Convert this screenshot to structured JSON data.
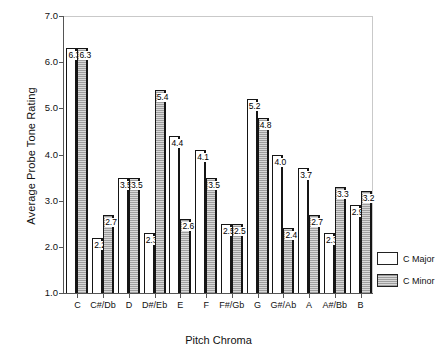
{
  "chart_data": {
    "type": "bar",
    "title": "",
    "xlabel": "Pitch Chroma",
    "ylabel": "Average Probe Tone Rating",
    "ylim": [
      1.0,
      7.0
    ],
    "ytick_step": 1.0,
    "yticks": [
      "1.0",
      "2.0",
      "3.0",
      "4.0",
      "5.0",
      "6.0",
      "7.0"
    ],
    "grid": false,
    "legend_position": "right-bottom-outside",
    "categories": [
      "C",
      "C#/Db",
      "D",
      "D#/Eb",
      "E",
      "F",
      "F#/Gb",
      "G",
      "G#/Ab",
      "A",
      "A#/Bb",
      "B"
    ],
    "series": [
      {
        "name": "C Major",
        "style": "white",
        "values": [
          6.3,
          2.2,
          3.5,
          2.3,
          4.4,
          4.1,
          2.5,
          5.2,
          4.0,
          3.7,
          2.3,
          2.9
        ],
        "labels": [
          "6.3",
          "2.2",
          "3.5",
          "2.3",
          "4.4",
          "4.1",
          "2.5",
          "5.2",
          "4.0",
          "3.7",
          "2.3",
          "2.9"
        ]
      },
      {
        "name": "C Minor",
        "style": "hatched-gray",
        "values": [
          6.3,
          2.7,
          3.5,
          5.4,
          2.6,
          3.5,
          2.5,
          4.8,
          2.4,
          2.7,
          3.3,
          3.2
        ],
        "labels": [
          "6.3",
          "2.7",
          "3.5",
          "5.4",
          "2.6",
          "3.5",
          "2.5",
          "4.8",
          "2.4",
          "2.7",
          "3.3",
          "3.2"
        ]
      }
    ]
  },
  "legend": {
    "items": [
      {
        "label": "C Major",
        "style": "major"
      },
      {
        "label": "C Minor",
        "style": "minor"
      }
    ]
  },
  "colors": {
    "axis": "#555555",
    "bar_outline": "#151515",
    "major_fill": "#ffffff",
    "minor_fill": "#c3c3c3",
    "text": "#111111"
  }
}
